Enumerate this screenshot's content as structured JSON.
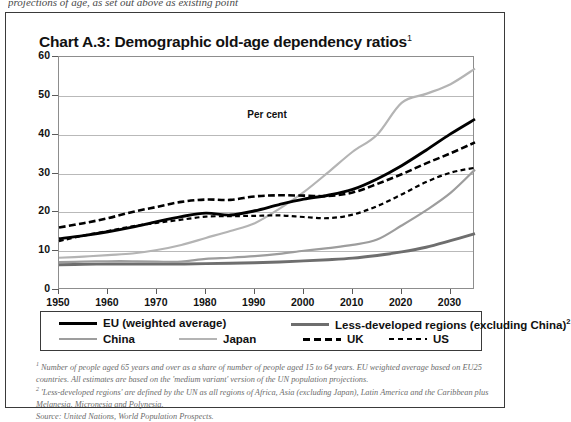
{
  "page": {
    "cutoff_text": "projections of age, as set out above as existing point"
  },
  "chart_title": "Chart A.3: Demographic old-age dependency ratios",
  "chart_title_sup": "1",
  "percent_label": "Per cent",
  "legend": {
    "items": [
      {
        "label": "EU (weighted average)",
        "sup": "",
        "color": "#000000",
        "style": "solid",
        "width": 2.9,
        "row": 0,
        "col": 0
      },
      {
        "label": "Less-developed regions (excluding China)",
        "sup": "2",
        "color": "#6e6e6e",
        "style": "solid",
        "width": 2.9,
        "row": 0,
        "col": 1
      },
      {
        "label": "China",
        "sup": "",
        "color": "#9d9d9d",
        "style": "solid",
        "width": 2.2,
        "row": 1,
        "col": 0
      },
      {
        "label": "Japan",
        "sup": "",
        "color": "#b4b4b4",
        "style": "solid",
        "width": 2.2,
        "row": 1,
        "col": 1
      },
      {
        "label": "UK",
        "sup": "",
        "color": "#000000",
        "style": "dashed",
        "width": 2.6,
        "row": 1,
        "col": 2
      },
      {
        "label": "US",
        "sup": "",
        "color": "#000000",
        "style": "dashed-short",
        "width": 2.2,
        "row": 1,
        "col": 3
      }
    ]
  },
  "footnotes": [
    "1 Number of people aged 65 years and over as a share of number of people aged 15 to 64 years. EU weighted average based on EU25 countries. All estimates are based on the 'medium variant' version of the UN population projections.",
    "2 'Less-developed regions' are defined by the UN as all regions of Africa, Asia (excluding Japan), Latin America and the Caribbean plus Melanesia, Micronesia and Polynesia.",
    "Source: United Nations, World Population Prospects."
  ],
  "chart_data": {
    "type": "line",
    "title": "Chart A.3: Demographic old-age dependency ratios",
    "xlabel": "",
    "ylabel": "Per cent",
    "xlim": [
      1950,
      2035
    ],
    "ylim": [
      0,
      60
    ],
    "ytick_values": [
      0,
      10,
      20,
      30,
      40,
      50,
      60
    ],
    "xtick_values": [
      1950,
      1960,
      1970,
      1980,
      1990,
      2000,
      2010,
      2020,
      2030
    ],
    "grid": true,
    "legend_position": "below-plot",
    "x": [
      1950,
      1955,
      1960,
      1965,
      1970,
      1975,
      1980,
      1985,
      1990,
      1995,
      2000,
      2005,
      2010,
      2015,
      2020,
      2025,
      2030,
      2035
    ],
    "series": [
      {
        "name": "EU (weighted average)",
        "color": "#000000",
        "style": "solid",
        "width": 2.9,
        "values": [
          13.2,
          14.0,
          15.0,
          16.2,
          17.6,
          18.9,
          19.8,
          19.3,
          20.4,
          22.0,
          23.4,
          24.4,
          25.9,
          28.6,
          32.0,
          36.0,
          40.2,
          44.0
        ]
      },
      {
        "name": "Less-developed regions (excluding China)",
        "color": "#6e6e6e",
        "style": "solid",
        "width": 2.9,
        "values": [
          6.5,
          6.6,
          6.7,
          6.7,
          6.7,
          6.7,
          6.8,
          6.9,
          7.0,
          7.2,
          7.5,
          7.8,
          8.2,
          8.9,
          9.8,
          11.0,
          12.7,
          14.5
        ]
      },
      {
        "name": "China",
        "color": "#9d9d9d",
        "style": "solid",
        "width": 2.2,
        "values": [
          7.2,
          7.3,
          7.4,
          7.4,
          7.3,
          7.3,
          8.0,
          8.3,
          8.7,
          9.3,
          10.1,
          10.8,
          11.6,
          13.0,
          16.6,
          20.5,
          25.0,
          31.0
        ]
      },
      {
        "name": "Japan",
        "color": "#b4b4b4",
        "style": "solid",
        "width": 2.2,
        "values": [
          8.3,
          8.6,
          9.0,
          9.4,
          10.3,
          11.6,
          13.4,
          15.2,
          17.2,
          20.9,
          25.2,
          30.3,
          35.6,
          40.0,
          48.2,
          50.5,
          53.0,
          57.0
        ]
      },
      {
        "name": "UK",
        "color": "#000000",
        "style": "dashed",
        "width": 2.6,
        "values": [
          16.1,
          17.2,
          18.5,
          20.1,
          21.4,
          22.7,
          23.3,
          23.2,
          24.1,
          24.4,
          24.3,
          24.2,
          25.1,
          27.3,
          29.8,
          32.6,
          35.2,
          38.0
        ]
      },
      {
        "name": "US",
        "color": "#000000",
        "style": "dashed-short",
        "width": 2.2,
        "values": [
          12.6,
          14.0,
          15.2,
          16.4,
          17.3,
          18.1,
          18.9,
          19.0,
          19.1,
          19.2,
          18.8,
          18.5,
          19.4,
          21.6,
          24.6,
          27.8,
          30.2,
          31.5
        ]
      }
    ]
  }
}
